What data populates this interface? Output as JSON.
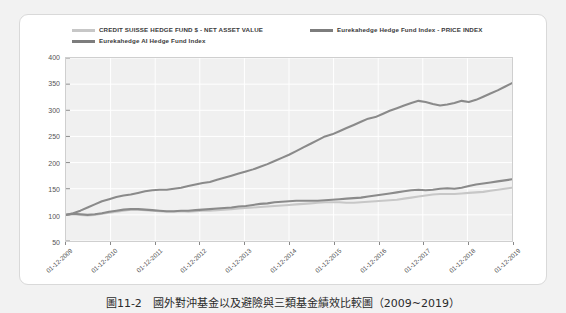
{
  "figure": {
    "caption": "圖11-2　國外對沖基金以及避險與三類基金績效比較圖（2009~2019）"
  },
  "chart_data": {
    "type": "line",
    "title": "",
    "xlabel": "",
    "ylabel": "",
    "ylim": [
      50,
      400
    ],
    "yticks": [
      50,
      100,
      150,
      200,
      250,
      300,
      350,
      400
    ],
    "grid": true,
    "legend_position": "top",
    "x": [
      "01-12-2009",
      "01-12-2010",
      "01-12-2011",
      "01-12-2012",
      "01-12-2013",
      "01-12-2014",
      "01-12-2015",
      "01-12-2016",
      "01-12-2017",
      "01-12-2018",
      "01-12-2019"
    ],
    "series": [
      {
        "name": "CREDIT SUISSE HEDGE FUND $ - NET ASSET VALUE",
        "color": "#c7c7c7",
        "values": [
          100,
          110,
          106,
          110,
          118,
          124,
          123,
          127,
          139,
          141,
          152
        ]
      },
      {
        "name": "Eurekahedge Hedge Fund Index - PRICE INDEX",
        "color": "#8a8a8a",
        "values": [
          100,
          111,
          107,
          112,
          121,
          127,
          127,
          133,
          147,
          150,
          168
        ]
      },
      {
        "name": "Eurekahedge AI Hedge Fund Index",
        "color": "#8a8a8a",
        "values": [
          100,
          139,
          147,
          163,
          187,
          215,
          254,
          287,
          318,
          311,
          352
        ]
      }
    ],
    "series_detail": [
      {
        "name": "CREDIT SUISSE HEDGE FUND $ - NET ASSET VALUE",
        "points": [
          100,
          101,
          100,
          99,
          100,
          102,
          104,
          106,
          108,
          110,
          110,
          109,
          108,
          107,
          106,
          106,
          107,
          106,
          107,
          108,
          108,
          109,
          110,
          111,
          112,
          113,
          114,
          115,
          116,
          117,
          118,
          119,
          120,
          121,
          122,
          123,
          124,
          124,
          124,
          123,
          123,
          124,
          125,
          126,
          127,
          128,
          129,
          131,
          133,
          135,
          137,
          139,
          140,
          140,
          140,
          141,
          142,
          143,
          144,
          146,
          148,
          150,
          152
        ]
      },
      {
        "name": "Eurekahedge Hedge Fund Index - PRICE INDEX",
        "points": [
          100,
          102,
          101,
          100,
          101,
          103,
          106,
          108,
          110,
          111,
          111,
          110,
          109,
          108,
          107,
          107,
          108,
          108,
          109,
          110,
          111,
          112,
          113,
          114,
          116,
          117,
          119,
          121,
          122,
          124,
          125,
          126,
          127,
          127,
          127,
          127,
          128,
          129,
          130,
          131,
          132,
          133,
          135,
          137,
          139,
          141,
          143,
          145,
          147,
          148,
          147,
          148,
          150,
          151,
          150,
          152,
          155,
          158,
          160,
          162,
          164,
          166,
          168
        ]
      },
      {
        "name": "Eurekahedge AI Hedge Fund Index",
        "points": [
          100,
          103,
          108,
          114,
          120,
          126,
          130,
          134,
          137,
          139,
          142,
          145,
          147,
          148,
          148,
          150,
          152,
          155,
          158,
          161,
          163,
          167,
          171,
          175,
          179,
          183,
          187,
          192,
          197,
          203,
          209,
          215,
          222,
          229,
          236,
          243,
          250,
          254,
          260,
          266,
          272,
          278,
          284,
          287,
          293,
          299,
          304,
          309,
          314,
          318,
          316,
          312,
          309,
          311,
          314,
          318,
          316,
          320,
          326,
          332,
          338,
          345,
          352
        ]
      }
    ]
  },
  "legend": {
    "items": [
      {
        "label": "CREDIT SUISSE HEDGE FUND $ - NET ASSET VALUE",
        "color": "#c7c7c7"
      },
      {
        "label": "Eurekahedge Hedge Fund Index - PRICE INDEX",
        "color": "#7d7d7d"
      },
      {
        "label": "Eurekahedge AI Hedge Fund Index",
        "color": "#7d7d7d"
      }
    ]
  }
}
